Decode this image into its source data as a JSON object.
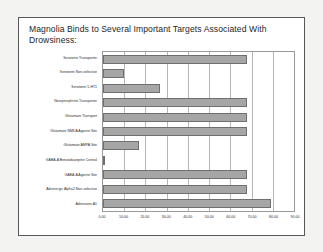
{
  "slide": {
    "title": "Magnolia Binds to Several Important Targets Associated With Drowsiness:"
  },
  "chart_data": {
    "type": "bar",
    "orientation": "horizontal",
    "title": "Magnolia Binds to Several Important Targets Associated With Drowsiness:",
    "xlabel": "",
    "ylabel": "",
    "xlim": [
      0,
      90
    ],
    "grid": true,
    "legend": false,
    "xticks": [
      "0.00",
      "10.00",
      "20.00",
      "30.00",
      "40.00",
      "50.00",
      "60.00",
      "70.00",
      "80.00",
      "90.00"
    ],
    "xtick_values": [
      0,
      10,
      20,
      30,
      40,
      50,
      60,
      70,
      80,
      90
    ],
    "categories": [
      "Serotonin Transporter",
      "Serotonin Non-selective",
      "Serotonin 5-HT1",
      "Norepinephrine Transporter",
      "Glutamate Transport",
      "Glutamate NMDA Agonist Site",
      "Glutamate AMPA Site",
      "GABA-A Benzodiazepine Central",
      "GABA-A Agonist Site",
      "Adrenergic Alpha2 Non-selective",
      "Adenosine A1"
    ],
    "values": [
      68,
      10,
      27,
      68,
      68,
      68,
      17,
      1,
      68,
      68,
      79
    ],
    "bar_color": "#a6a6a6",
    "bar_border_color": "#6f6f6f"
  }
}
